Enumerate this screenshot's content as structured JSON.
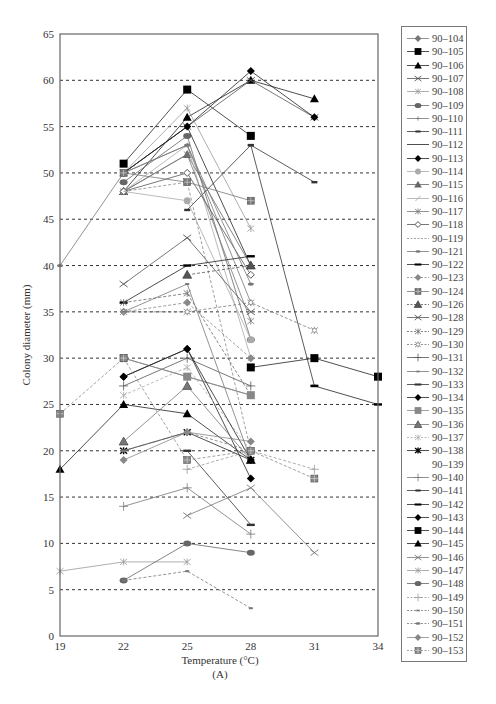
{
  "chart_data": {
    "type": "line",
    "title": "",
    "panel_label": "(A)",
    "xlabel": "Temperature (°C)",
    "ylabel": "Colony diameter (mm)",
    "xlim": [
      19,
      34
    ],
    "ylim": [
      0,
      65
    ],
    "x_ticks": [
      19,
      22,
      25,
      28,
      31,
      34
    ],
    "y_ticks": [
      0,
      5,
      10,
      15,
      20,
      25,
      30,
      35,
      40,
      45,
      50,
      55,
      60,
      65
    ],
    "grid": "horizontal dashed at each y tick (5–60)",
    "legend_position": "right",
    "series": [
      {
        "name": "90–104",
        "marker": "diamond",
        "color": "#777777",
        "dash": false,
        "points": [
          [
            22,
            30
          ],
          [
            25,
            28
          ],
          [
            28,
            26
          ]
        ]
      },
      {
        "name": "90–105",
        "marker": "square",
        "color": "#000000",
        "dash": false,
        "points": [
          [
            22,
            51
          ],
          [
            25,
            59
          ],
          [
            28,
            54
          ]
        ]
      },
      {
        "name": "90–106",
        "marker": "triangle",
        "color": "#000000",
        "dash": false,
        "points": [
          [
            22,
            48
          ],
          [
            25,
            56
          ],
          [
            28,
            60
          ],
          [
            31,
            58
          ]
        ]
      },
      {
        "name": "90–107",
        "marker": "x",
        "color": "#555555",
        "dash": false,
        "points": [
          [
            22,
            50
          ],
          [
            25,
            55
          ],
          [
            28,
            60
          ],
          [
            31,
            56
          ]
        ]
      },
      {
        "name": "90–108",
        "marker": "asterisk",
        "color": "#999999",
        "dash": false,
        "points": [
          [
            22,
            50
          ],
          [
            25,
            57
          ],
          [
            28,
            44
          ]
        ]
      },
      {
        "name": "90–109",
        "marker": "hexagon",
        "color": "#666666",
        "dash": false,
        "points": [
          [
            22,
            49
          ],
          [
            25,
            54
          ],
          [
            28,
            32
          ]
        ]
      },
      {
        "name": "90–110",
        "marker": "plus-small",
        "color": "#777777",
        "dash": false,
        "points": [
          [
            22,
            50
          ],
          [
            25,
            53
          ],
          [
            28,
            36
          ]
        ]
      },
      {
        "name": "90–111",
        "marker": "dash-short",
        "color": "#333333",
        "dash": false,
        "points": [
          [
            25,
            46
          ],
          [
            28,
            53
          ],
          [
            31,
            49
          ]
        ]
      },
      {
        "name": "90–112",
        "marker": "none-line",
        "color": "#000000",
        "dash": false,
        "points": [
          [
            22,
            50
          ],
          [
            25,
            55
          ],
          [
            28,
            40
          ]
        ]
      },
      {
        "name": "90–113",
        "marker": "diamond",
        "color": "#000000",
        "dash": false,
        "points": [
          [
            22,
            50
          ],
          [
            25,
            55
          ],
          [
            28,
            61
          ],
          [
            31,
            56
          ]
        ]
      },
      {
        "name": "90–114",
        "marker": "circle",
        "color": "#aaaaaa",
        "dash": false,
        "points": [
          [
            22,
            48
          ],
          [
            25,
            47
          ],
          [
            28,
            32
          ]
        ]
      },
      {
        "name": "90–115",
        "marker": "triangle",
        "color": "#666666",
        "dash": false,
        "points": [
          [
            22,
            48
          ],
          [
            25,
            52
          ],
          [
            28,
            40
          ]
        ]
      },
      {
        "name": "90–116",
        "marker": "slash",
        "color": "#aaaaaa",
        "dash": false,
        "points": [
          [
            22,
            48
          ],
          [
            25,
            53
          ],
          [
            28,
            30
          ]
        ]
      },
      {
        "name": "90–117",
        "marker": "asterisk",
        "color": "#777777",
        "dash": false,
        "points": [
          [
            22,
            48
          ],
          [
            25,
            52
          ],
          [
            28,
            34
          ]
        ]
      },
      {
        "name": "90–118",
        "marker": "diamond-open",
        "color": "#555555",
        "dash": false,
        "points": [
          [
            22,
            48
          ],
          [
            25,
            50
          ],
          [
            28,
            39
          ]
        ]
      },
      {
        "name": "90–119",
        "marker": "none",
        "color": "#888888",
        "dash": true,
        "points": [
          [
            22,
            48
          ],
          [
            25,
            49
          ],
          [
            28,
            20
          ]
        ]
      },
      {
        "name": "90–121",
        "marker": "oval-small",
        "color": "#777777",
        "dash": false,
        "points": [
          [
            19,
            40
          ],
          [
            22,
            50
          ],
          [
            25,
            53
          ],
          [
            28,
            38
          ]
        ]
      },
      {
        "name": "90–122",
        "marker": "dash",
        "color": "#000000",
        "dash": false,
        "points": [
          [
            22,
            36
          ],
          [
            25,
            40
          ],
          [
            28,
            41
          ]
        ]
      },
      {
        "name": "90–123",
        "marker": "diamond",
        "color": "#888888",
        "dash": true,
        "points": [
          [
            22,
            35
          ],
          [
            25,
            36
          ],
          [
            28,
            30
          ]
        ]
      },
      {
        "name": "90–124",
        "marker": "square-grid",
        "color": "#777777",
        "dash": false,
        "points": [
          [
            22,
            50
          ],
          [
            25,
            49
          ],
          [
            28,
            47
          ]
        ]
      },
      {
        "name": "90–126",
        "marker": "triangle-hatched",
        "color": "#555555",
        "dash": true,
        "points": [
          [
            25,
            39
          ],
          [
            28,
            40
          ]
        ]
      },
      {
        "name": "90–128",
        "marker": "x",
        "color": "#555555",
        "dash": false,
        "points": [
          [
            22,
            38
          ],
          [
            25,
            43
          ],
          [
            28,
            35
          ]
        ]
      },
      {
        "name": "90–129",
        "marker": "asterisk",
        "color": "#666666",
        "dash": true,
        "points": [
          [
            22,
            36
          ],
          [
            25,
            37
          ],
          [
            28,
            26
          ]
        ]
      },
      {
        "name": "90–130",
        "marker": "asterisk-open",
        "color": "#777777",
        "dash": true,
        "points": [
          [
            22,
            35
          ],
          [
            25,
            35
          ],
          [
            28,
            36
          ],
          [
            31,
            33
          ]
        ]
      },
      {
        "name": "90–131",
        "marker": "plus",
        "color": "#555555",
        "dash": false,
        "points": [
          [
            22,
            27
          ],
          [
            25,
            30
          ],
          [
            28,
            27
          ]
        ]
      },
      {
        "name": "90–132",
        "marker": "dot",
        "color": "#777777",
        "dash": false,
        "points": [
          [
            22,
            35
          ],
          [
            25,
            38
          ],
          [
            28,
            19
          ]
        ]
      },
      {
        "name": "90–133",
        "marker": "dash",
        "color": "#333333",
        "dash": false,
        "points": [
          [
            25,
            20
          ],
          [
            28,
            12
          ]
        ]
      },
      {
        "name": "90–134",
        "marker": "diamond",
        "color": "#000000",
        "dash": false,
        "points": [
          [
            22,
            28
          ],
          [
            25,
            31
          ],
          [
            28,
            17
          ]
        ]
      },
      {
        "name": "90–135",
        "marker": "square",
        "color": "#888888",
        "dash": false,
        "points": [
          [
            22,
            30
          ],
          [
            25,
            28
          ],
          [
            28,
            26
          ]
        ]
      },
      {
        "name": "90–136",
        "marker": "triangle-hatched",
        "color": "#777777",
        "dash": false,
        "points": [
          [
            22,
            21
          ],
          [
            25,
            27
          ],
          [
            28,
            19
          ]
        ]
      },
      {
        "name": "90–137",
        "marker": "asterisk",
        "color": "#aaaaaa",
        "dash": true,
        "points": [
          [
            22,
            26
          ],
          [
            25,
            29
          ],
          [
            28,
            20
          ]
        ]
      },
      {
        "name": "90–138",
        "marker": "asterisk-bold",
        "color": "#000000",
        "dash": false,
        "points": [
          [
            22,
            20
          ],
          [
            25,
            22
          ],
          [
            28,
            19
          ]
        ]
      },
      {
        "name": "90–139",
        "marker": "none",
        "color": "#cccccc",
        "dash": false,
        "points": []
      },
      {
        "name": "90–140",
        "marker": "plus",
        "color": "#777777",
        "dash": false,
        "points": [
          [
            22,
            14
          ],
          [
            25,
            16
          ],
          [
            28,
            11
          ]
        ]
      },
      {
        "name": "90–141",
        "marker": "dash-short",
        "color": "#333333",
        "dash": false,
        "points": [
          [
            28,
            53
          ],
          [
            31,
            27
          ]
        ]
      },
      {
        "name": "90–142",
        "marker": "dash",
        "color": "#000000",
        "dash": false,
        "points": [
          [
            31,
            27
          ],
          [
            34,
            25
          ]
        ]
      },
      {
        "name": "90–143",
        "marker": "diamond",
        "color": "#000000",
        "dash": false,
        "points": [
          [
            22,
            28
          ],
          [
            25,
            31
          ],
          [
            28,
            19
          ]
        ]
      },
      {
        "name": "90–144",
        "marker": "square",
        "color": "#000000",
        "dash": false,
        "points": [
          [
            28,
            29
          ],
          [
            31,
            30
          ],
          [
            34,
            28
          ]
        ]
      },
      {
        "name": "90–145",
        "marker": "triangle",
        "color": "#000000",
        "dash": false,
        "points": [
          [
            19,
            18
          ],
          [
            22,
            25
          ],
          [
            25,
            24
          ],
          [
            28,
            19
          ]
        ]
      },
      {
        "name": "90–146",
        "marker": "x",
        "color": "#777777",
        "dash": false,
        "points": [
          [
            25,
            13
          ],
          [
            28,
            16
          ],
          [
            31,
            9
          ]
        ]
      },
      {
        "name": "90–147",
        "marker": "asterisk",
        "color": "#999999",
        "dash": false,
        "points": [
          [
            19,
            7
          ],
          [
            22,
            8
          ],
          [
            25,
            8
          ]
        ]
      },
      {
        "name": "90–148",
        "marker": "hexagon",
        "color": "#666666",
        "dash": false,
        "points": [
          [
            22,
            6
          ],
          [
            25,
            10
          ],
          [
            28,
            9
          ]
        ]
      },
      {
        "name": "90–149",
        "marker": "plus-thin",
        "color": "#999999",
        "dash": true,
        "points": [
          [
            25,
            18
          ],
          [
            28,
            20
          ],
          [
            31,
            18
          ]
        ]
      },
      {
        "name": "90–150",
        "marker": "dot",
        "color": "#777777",
        "dash": true,
        "points": [
          [
            22,
            6
          ],
          [
            25,
            7
          ],
          [
            28,
            3
          ]
        ]
      },
      {
        "name": "90–151",
        "marker": "oval-small",
        "color": "#777777",
        "dash": true,
        "points": [
          [
            22,
            20
          ],
          [
            25,
            22
          ],
          [
            28,
            20
          ]
        ]
      },
      {
        "name": "90–152",
        "marker": "diamond",
        "color": "#888888",
        "dash": false,
        "points": [
          [
            22,
            19
          ],
          [
            25,
            22
          ],
          [
            28,
            21
          ]
        ]
      },
      {
        "name": "90–153",
        "marker": "square-grid",
        "color": "#888888",
        "dash": true,
        "points": [
          [
            19,
            24
          ],
          [
            22,
            30
          ],
          [
            25,
            19
          ],
          [
            28,
            20
          ],
          [
            31,
            17
          ]
        ]
      }
    ],
    "extra_segments_note": "Additional unlabeled series at 22°C (~9.5, triangle) rising to 25°C (~12) and 28°C (~11); many lines from 25°C cluster converge near 19–20 mm at 28°C."
  },
  "legend": {
    "entries": [
      "90–104",
      "90–105",
      "90–106",
      "90–107",
      "90–108",
      "90–109",
      "90–110",
      "90–111",
      "90–112",
      "90–113",
      "90–114",
      "90–115",
      "90–116",
      "90–117",
      "90–118",
      "90–119",
      "90–121",
      "90–122",
      "90–123",
      "90–124",
      "90–126",
      "90–128",
      "90–129",
      "90–130",
      "90–131",
      "90–132",
      "90–133",
      "90–134",
      "90–135",
      "90–136",
      "90–137",
      "90–138",
      "90–139",
      "90–140",
      "90–141",
      "90–142",
      "90–143",
      "90–144",
      "90–145",
      "90–146",
      "90–147",
      "90–148",
      "90–149",
      "90–150",
      "90–151",
      "90–152",
      "90–153"
    ]
  }
}
